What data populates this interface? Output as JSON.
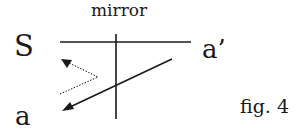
{
  "diagram": {
    "title_label": "mirror",
    "labels": {
      "source": "S",
      "image_point": "a’",
      "point": "a",
      "figure": "fig. 4"
    },
    "colors": {
      "line": "#1a1a1a",
      "background": "#ffffff"
    },
    "elements": {
      "mirror_line": {
        "x1": 116,
        "y1": 34,
        "x2": 116,
        "y2": 119,
        "style": "solid"
      },
      "horizontal_line": {
        "x1": 60,
        "y1": 42,
        "x2": 191,
        "y2": 42,
        "style": "solid"
      },
      "solid_arrow": {
        "from": [
          172,
          59
        ],
        "to": [
          63,
          110
        ],
        "style": "solid",
        "head": "filled-triangle"
      },
      "dotted_arrow": {
        "points": [
          [
            60,
            94
          ],
          [
            98,
            77
          ],
          [
            63,
            60
          ]
        ],
        "style": "dotted",
        "head": "filled-triangle"
      }
    }
  }
}
